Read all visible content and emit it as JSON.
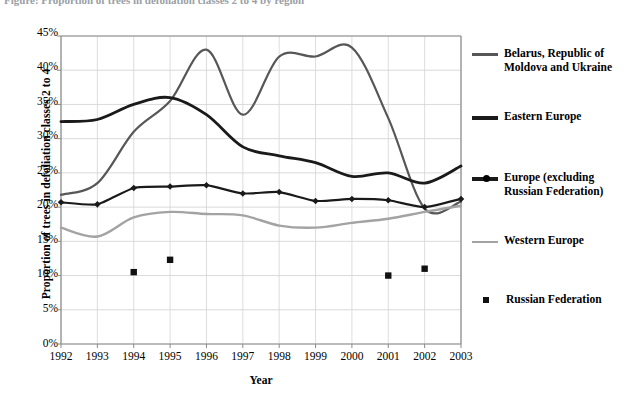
{
  "caption": {
    "text": "Figure: Proportion of trees in defoliation classes 2 to 4 by region"
  },
  "axes": {
    "xlabel": "Year",
    "ylabel": "Proportion of trees in defoliation classes 2 to 4",
    "yticks": [
      "0%",
      "5%",
      "10%",
      "15%",
      "20%",
      "25%",
      "30%",
      "35%",
      "40%",
      "45%"
    ],
    "xticks": [
      "1992",
      "1993",
      "1994",
      "1995",
      "1996",
      "1997",
      "1998",
      "1999",
      "2000",
      "2001",
      "2002",
      "2003"
    ]
  },
  "legend": [
    {
      "label": "Belarus, Republic of Moldova and Ukraine",
      "style": "line-gray-thick",
      "color": "#575757"
    },
    {
      "label": "Eastern Europe",
      "style": "line-black-thick",
      "color": "#1a1a1a"
    },
    {
      "label": "Europe (excluding Russian Federation)",
      "style": "line-black-marker",
      "color": "#1a1a1a"
    },
    {
      "label": "Western Europe",
      "style": "line-gray-thin",
      "color": "#a3a3a3"
    },
    {
      "label": "Russian Federation",
      "style": "square-marker",
      "color": "#111111"
    }
  ],
  "chart_data": {
    "type": "line",
    "title": "",
    "xlabel": "Year",
    "ylabel": "Proportion of trees in defoliation classes 2 to 4",
    "x": [
      1992,
      1993,
      1994,
      1995,
      1996,
      1997,
      1998,
      1999,
      2000,
      2001,
      2002,
      2003
    ],
    "xlim": [
      1992,
      2003
    ],
    "ylim": [
      0,
      45
    ],
    "ytick_step": 5,
    "grid": true,
    "legend_position": "right",
    "units": "percent",
    "series": [
      {
        "name": "Belarus, Republic of Moldova and Ukraine",
        "color": "#575757",
        "marker": "none",
        "values": [
          21.8,
          23.5,
          31.0,
          35.5,
          43.0,
          33.5,
          42.0,
          42.0,
          43.3,
          33.0,
          19.8,
          20.8
        ]
      },
      {
        "name": "Eastern Europe",
        "color": "#1a1a1a",
        "marker": "none",
        "values": [
          32.5,
          32.8,
          35.0,
          36.0,
          33.5,
          28.8,
          27.5,
          26.5,
          24.5,
          25.0,
          23.5,
          26.0
        ]
      },
      {
        "name": "Europe (excluding Russian Federation)",
        "color": "#1a1a1a",
        "marker": "diamond",
        "values": [
          20.7,
          20.4,
          22.8,
          23.0,
          23.2,
          22.0,
          22.2,
          20.9,
          21.2,
          21.0,
          20.0,
          21.2
        ]
      },
      {
        "name": "Western Europe",
        "color": "#a3a3a3",
        "marker": "none",
        "values": [
          17.0,
          15.7,
          18.5,
          19.3,
          19.0,
          18.8,
          17.3,
          17.0,
          17.7,
          18.3,
          19.3,
          20.2
        ]
      },
      {
        "name": "Russian Federation",
        "color": "#111111",
        "marker": "square",
        "style": "points-only",
        "points": [
          {
            "x": 1994,
            "y": 10.5
          },
          {
            "x": 1995,
            "y": 12.3
          },
          {
            "x": 2001,
            "y": 10.0
          },
          {
            "x": 2002,
            "y": 11.0
          }
        ]
      }
    ]
  }
}
